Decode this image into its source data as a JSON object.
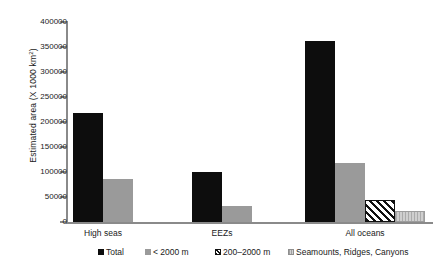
{
  "chart_data": {
    "type": "bar",
    "title": "",
    "xlabel": "",
    "ylabel_text": "Estimated area (X 1000 km",
    "ylabel_sup": "2",
    "ylabel_tail": ")",
    "categories": [
      "High seas",
      "EEZs",
      "All oceans"
    ],
    "ylim": [
      0,
      400000
    ],
    "ytick_values": [
      0,
      50000,
      100000,
      150000,
      200000,
      250000,
      300000,
      350000,
      400000
    ],
    "ytick_labels": [
      "0",
      "50000",
      "100000",
      "150000",
      "200000",
      "250000",
      "300000",
      "350000",
      "400000"
    ],
    "grid": false,
    "legend_position": "bottom",
    "series": [
      {
        "name": "Total",
        "color": "#0d0d0d",
        "fill": "solid-black",
        "values": [
          218000,
          100000,
          362000
        ]
      },
      {
        "name": "< 2000 m",
        "color": "#9a9a9a",
        "fill": "solid-gray",
        "values": [
          86000,
          32000,
          118000
        ]
      },
      {
        "name": "200–2000 m",
        "color": "#111111",
        "fill": "diagonal-hatch",
        "values": [
          null,
          null,
          44000
        ]
      },
      {
        "name": "Seamounts, Ridges, Canyons",
        "color": "#c2c2c2",
        "fill": "light-gray-lines",
        "values": [
          null,
          null,
          22000
        ]
      }
    ]
  },
  "legend": {
    "items": [
      {
        "label": "Total"
      },
      {
        "label": "< 2000 m"
      },
      {
        "label": "200–2000 m"
      },
      {
        "label": "Seamounts, Ridges, Canyons"
      }
    ]
  }
}
